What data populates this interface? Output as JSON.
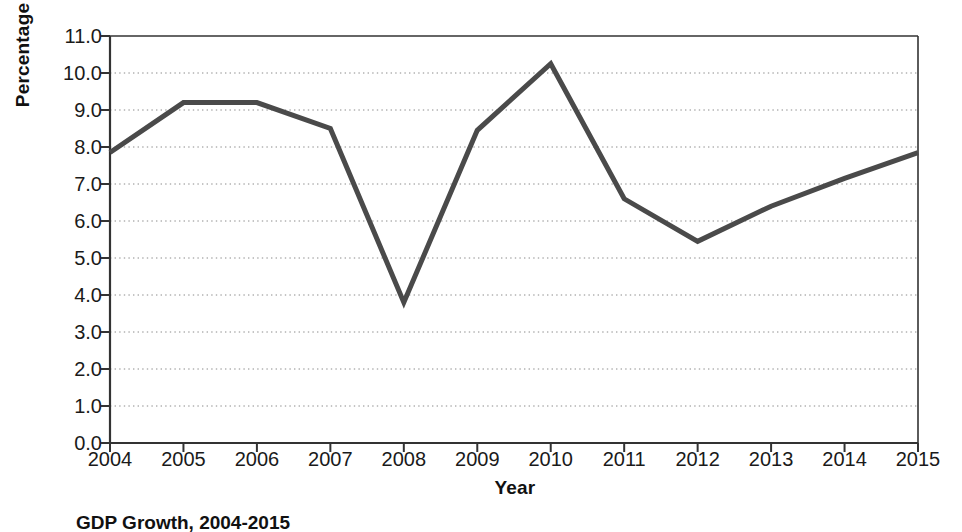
{
  "chart_data": {
    "type": "line",
    "title": "GDP Growth, 2004-2015",
    "xlabel": "Year",
    "ylabel": "Percentage",
    "categories": [
      "2004",
      "2005",
      "2006",
      "2007",
      "2008",
      "2009",
      "2010",
      "2011",
      "2012",
      "2013",
      "2014",
      "2015"
    ],
    "values": [
      7.85,
      9.2,
      9.2,
      8.5,
      3.8,
      8.45,
      10.25,
      6.6,
      5.45,
      6.4,
      7.15,
      7.85
    ],
    "series": [
      {
        "name": "GDP Growth",
        "values": [
          7.85,
          9.2,
          9.2,
          8.5,
          3.8,
          8.45,
          10.25,
          6.6,
          5.45,
          6.4,
          7.15,
          7.85
        ]
      }
    ],
    "ylim": [
      0.0,
      11.0
    ],
    "ytick_labels": [
      "0.0",
      "1.0",
      "2.0",
      "3.0",
      "4.0",
      "5.0",
      "6.0",
      "7.0",
      "8.0",
      "9.0",
      "10.0",
      "11.0"
    ],
    "ytick_values": [
      0,
      1,
      2,
      3,
      4,
      5,
      6,
      7,
      8,
      9,
      10,
      11
    ],
    "xtick_labels": [
      "2004",
      "2005",
      "2006",
      "2007",
      "2008",
      "2009",
      "2010",
      "2011",
      "2012",
      "2013",
      "2014",
      "2015"
    ],
    "grid": "horizontal-dotted",
    "legend": "none",
    "line_color": "#4a4a4a",
    "axis_color": "#333333",
    "grid_color": "#8a8a8a"
  },
  "caption": {
    "label": "",
    "text": "GDP Growth, 2004-2015"
  }
}
